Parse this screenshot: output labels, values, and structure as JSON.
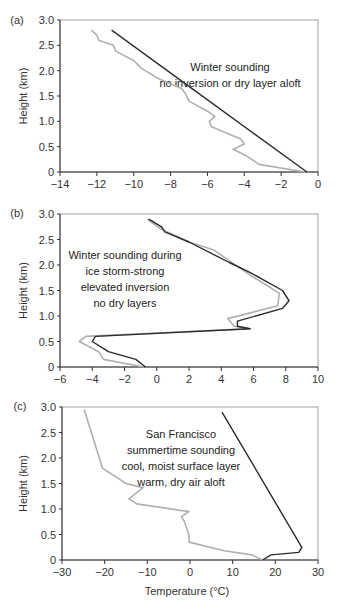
{
  "chart_data": [
    {
      "type": "line",
      "panel": "(a)",
      "title": "",
      "annotation": [
        "Winter sounding",
        "no inversion or dry layer aloft"
      ],
      "xlabel": "",
      "ylabel": "Height (km)",
      "xlim": [
        -14,
        0
      ],
      "ylim": [
        0,
        3.0
      ],
      "xticks": [
        -14,
        -12,
        -10,
        -8,
        -6,
        -4,
        -2,
        0
      ],
      "yticks": [
        0,
        0.5,
        1.0,
        1.5,
        2.0,
        2.5,
        3.0
      ],
      "ytick_labels": [
        "0",
        "0.5",
        "1.0",
        "1.5",
        "2.0",
        "2.5",
        "3.0"
      ],
      "grid": false,
      "series": [
        {
          "name": "temperature",
          "color": "#2b2b2b",
          "points": [
            [
              -11.2,
              2.8
            ],
            [
              -0.6,
              0.0
            ]
          ]
        },
        {
          "name": "dewpoint",
          "color": "#b0b0b0",
          "points": [
            [
              -12.3,
              2.8
            ],
            [
              -12.0,
              2.7
            ],
            [
              -11.9,
              2.6
            ],
            [
              -11.1,
              2.5
            ],
            [
              -11.0,
              2.4
            ],
            [
              -10.8,
              2.35
            ],
            [
              -10.0,
              2.2
            ],
            [
              -9.6,
              2.05
            ],
            [
              -8.7,
              1.85
            ],
            [
              -7.4,
              1.65
            ],
            [
              -7.2,
              1.55
            ],
            [
              -7.0,
              1.4
            ],
            [
              -6.0,
              1.2
            ],
            [
              -5.6,
              1.1
            ],
            [
              -5.9,
              1.0
            ],
            [
              -5.8,
              0.9
            ],
            [
              -4.2,
              0.65
            ],
            [
              -4.0,
              0.55
            ],
            [
              -4.6,
              0.45
            ],
            [
              -3.8,
              0.3
            ],
            [
              -3.2,
              0.15
            ],
            [
              -0.7,
              0.0
            ]
          ]
        }
      ]
    },
    {
      "type": "line",
      "panel": "(b)",
      "title": "",
      "annotation": [
        "Winter sounding during",
        "ice storm-strong",
        "elevated inversion",
        "no dry layers"
      ],
      "xlabel": "",
      "ylabel": "Height (km)",
      "xlim": [
        -6,
        10
      ],
      "ylim": [
        0,
        3.0
      ],
      "xticks": [
        -6,
        -4,
        -2,
        0,
        2,
        4,
        6,
        8,
        10
      ],
      "yticks": [
        0,
        0.5,
        1.0,
        1.5,
        2.0,
        2.5,
        3.0
      ],
      "ytick_labels": [
        "0",
        "0.5",
        "1.0",
        "1.5",
        "2.0",
        "2.5",
        "3.0"
      ],
      "grid": false,
      "series": [
        {
          "name": "temperature",
          "color": "#2b2b2b",
          "points": [
            [
              -0.7,
              0.0
            ],
            [
              -1.3,
              0.15
            ],
            [
              -3.0,
              0.3
            ],
            [
              -4.0,
              0.5
            ],
            [
              -3.8,
              0.6
            ],
            [
              5.8,
              0.75
            ],
            [
              5.0,
              0.8
            ],
            [
              5.0,
              0.9
            ],
            [
              7.8,
              1.15
            ],
            [
              8.2,
              1.3
            ],
            [
              7.8,
              1.5
            ],
            [
              5.8,
              1.85
            ],
            [
              4.5,
              2.05
            ],
            [
              2.0,
              2.45
            ],
            [
              0.5,
              2.65
            ],
            [
              0.3,
              2.75
            ],
            [
              -0.5,
              2.9
            ]
          ]
        },
        {
          "name": "dewpoint",
          "color": "#b0b0b0",
          "points": [
            [
              -0.8,
              0.0
            ],
            [
              -3.3,
              0.15
            ],
            [
              -3.6,
              0.3
            ],
            [
              -4.8,
              0.5
            ],
            [
              -4.4,
              0.6
            ],
            [
              5.7,
              0.75
            ],
            [
              4.8,
              0.8
            ],
            [
              4.4,
              0.95
            ],
            [
              7.5,
              1.2
            ],
            [
              7.6,
              1.45
            ],
            [
              5.8,
              1.8
            ],
            [
              3.5,
              2.3
            ],
            [
              2.0,
              2.45
            ],
            [
              0.3,
              2.7
            ],
            [
              -0.6,
              2.9
            ]
          ]
        }
      ]
    },
    {
      "type": "line",
      "panel": "(c)",
      "title": "",
      "annotation": [
        "San Francisco",
        "summertime sounding",
        "cool, moist surface layer",
        "warm, dry air aloft"
      ],
      "xlabel": "Temperature (°C)",
      "ylabel": "Height (km)",
      "xlim": [
        -30,
        30
      ],
      "ylim": [
        0,
        3.0
      ],
      "xticks": [
        -30,
        -20,
        -10,
        0,
        10,
        20,
        30
      ],
      "yticks": [
        0,
        0.5,
        1.0,
        1.5,
        2.0,
        2.5,
        3.0
      ],
      "ytick_labels": [
        "0",
        "0.5",
        "1.0",
        "1.5",
        "2.0",
        "2.5",
        "3.0"
      ],
      "grid": false,
      "series": [
        {
          "name": "temperature",
          "color": "#2b2b2b",
          "points": [
            [
              17.0,
              0.0
            ],
            [
              19.0,
              0.1
            ],
            [
              25.5,
              0.15
            ],
            [
              26.2,
              0.25
            ],
            [
              7.5,
              2.9
            ]
          ]
        },
        {
          "name": "dewpoint",
          "color": "#b0b0b0",
          "points": [
            [
              17.0,
              0.0
            ],
            [
              14.5,
              0.1
            ],
            [
              8.0,
              0.18
            ],
            [
              -0.2,
              0.35
            ],
            [
              -0.3,
              0.5
            ],
            [
              -1.3,
              0.75
            ],
            [
              -2.0,
              0.85
            ],
            [
              -0.2,
              0.95
            ],
            [
              -12.5,
              1.1
            ],
            [
              -14.3,
              1.2
            ],
            [
              -11.0,
              1.42
            ],
            [
              -15.0,
              1.5
            ],
            [
              -20.5,
              1.8
            ],
            [
              -24.8,
              2.95
            ]
          ]
        }
      ]
    }
  ],
  "panels": {
    "a": {
      "label": "(a)"
    },
    "b": {
      "label": "(b)"
    },
    "c": {
      "label": "(c)"
    }
  },
  "labels": {
    "ylabel": "Height (km)",
    "xlabel_c": "Temperature (°C)"
  }
}
